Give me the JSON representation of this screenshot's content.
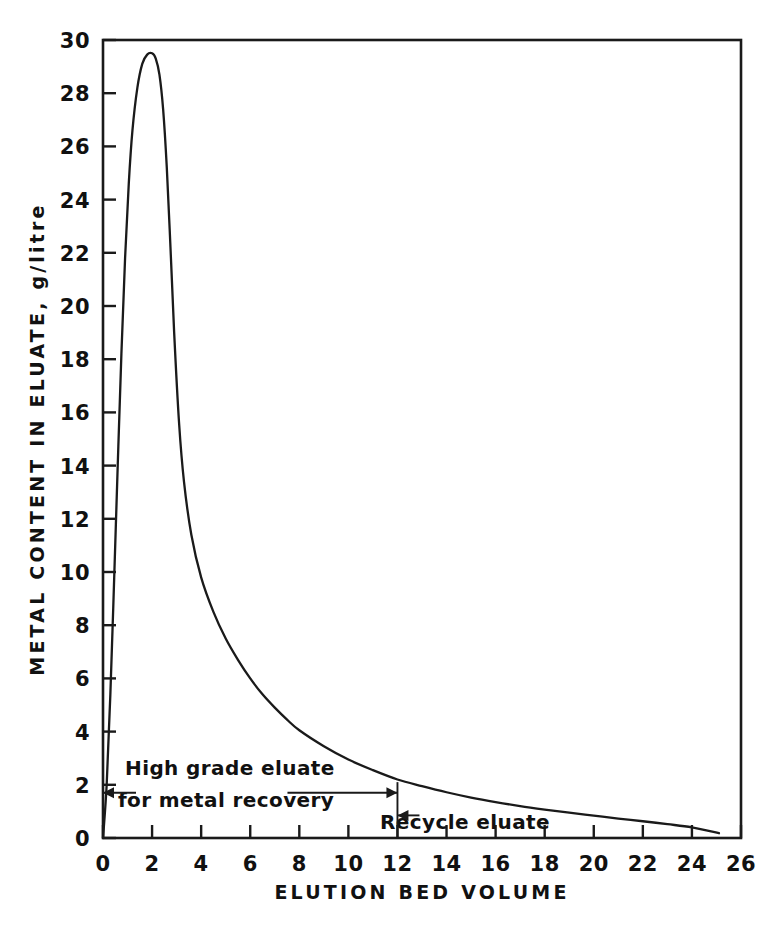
{
  "chart_data": {
    "type": "line",
    "title": "",
    "xlabel": "ELUTION BED VOLUME",
    "ylabel": "METAL CONTENT IN ELUATE,  g/litre",
    "xlim": [
      0,
      26
    ],
    "ylim": [
      0,
      30
    ],
    "xticks": [
      0,
      2,
      4,
      6,
      8,
      10,
      12,
      14,
      16,
      18,
      20,
      22,
      24,
      26
    ],
    "yticks": [
      0,
      2,
      4,
      6,
      8,
      10,
      12,
      14,
      16,
      18,
      20,
      22,
      24,
      26,
      28,
      30
    ],
    "xtick_labels": [
      "0",
      "2",
      "4",
      "6",
      "8",
      "10",
      "12",
      "14",
      "16",
      "18",
      "20",
      "22",
      "24",
      "26"
    ],
    "ytick_labels": [
      "0",
      "2",
      "4",
      "6",
      "8",
      "10",
      "12",
      "14",
      "16",
      "18",
      "20",
      "22",
      "24",
      "26",
      "28",
      "30"
    ],
    "grid": false,
    "legend": false,
    "series": [
      {
        "name": "Metal content in eluate",
        "color": "#1a1a1a",
        "x": [
          0.0,
          0.15,
          0.3,
          0.45,
          0.6,
          0.75,
          0.9,
          1.05,
          1.2,
          1.4,
          1.6,
          1.8,
          2.0,
          2.15,
          2.3,
          2.45,
          2.6,
          2.75,
          2.9,
          3.1,
          3.3,
          3.6,
          4.0,
          4.5,
          5.0,
          5.5,
          6.0,
          6.5,
          7.0,
          7.5,
          8.0,
          9.0,
          10.0,
          11.0,
          12.0,
          13.0,
          14.0,
          15.0,
          16.0,
          17.0,
          18.0,
          19.0,
          20.0,
          21.0,
          22.0,
          23.0,
          24.0,
          25.1
        ],
        "y": [
          0.0,
          2.0,
          5.4,
          9.6,
          14.0,
          18.2,
          21.8,
          24.6,
          26.6,
          28.2,
          29.1,
          29.45,
          29.5,
          29.3,
          28.7,
          27.4,
          25.2,
          22.2,
          19.0,
          15.6,
          13.4,
          11.4,
          9.8,
          8.5,
          7.5,
          6.7,
          6.0,
          5.4,
          4.9,
          4.45,
          4.05,
          3.45,
          2.95,
          2.55,
          2.2,
          1.95,
          1.72,
          1.52,
          1.35,
          1.2,
          1.07,
          0.95,
          0.84,
          0.73,
          0.63,
          0.52,
          0.4,
          0.18
        ]
      }
    ],
    "annotations": [
      {
        "id": "high-grade",
        "line1": "High grade eluate",
        "line2": "for metal recovery",
        "arrow": "double",
        "x_from": 0,
        "x_to": 12,
        "y": 1.7
      },
      {
        "id": "recycle",
        "text": "Recycle eluate",
        "arrow": "single-left",
        "x_from": 12,
        "y": 0.85
      }
    ],
    "divider": {
      "x": 12,
      "y_top": 2.1,
      "y_bottom": 0
    }
  },
  "axes": {
    "x_title": "ELUTION BED VOLUME",
    "y_title": "METAL CONTENT IN ELUATE,  g/litre"
  },
  "annotations": {
    "high_grade_line1": "High grade eluate",
    "high_grade_line2": "for metal recovery",
    "recycle": "Recycle eluate"
  },
  "style": {
    "background": "#ffffff",
    "ink": "#1a1a1a"
  }
}
